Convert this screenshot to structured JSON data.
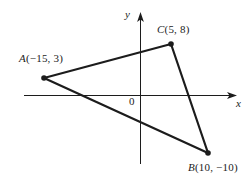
{
  "figure": {
    "background_color": "#ffffff",
    "line_color": "#1c1c1c",
    "axes": {
      "x_label": "x",
      "y_label": "y",
      "origin_label": "0"
    },
    "vertex_labels": {
      "a": {
        "letter": "A",
        "coords": "(−15, 3)"
      },
      "c": {
        "letter": "C",
        "coords": "(5, 8)"
      },
      "b": {
        "letter": "B",
        "coords": "(10, −10)"
      }
    },
    "points": [
      {
        "name": "A",
        "x": -15,
        "y": 3
      },
      {
        "name": "C",
        "x": 5,
        "y": 8
      },
      {
        "name": "B",
        "x": 10,
        "y": -10
      }
    ]
  }
}
